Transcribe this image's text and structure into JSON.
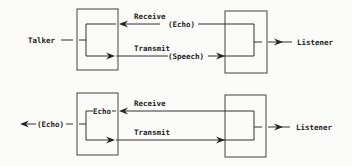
{
  "diagrams": [
    {
      "name": "without-echo-canceller",
      "talker_label": "Talker",
      "listener_label": "Listener",
      "receive_label": "Receive",
      "receive_signal": "(Echo)",
      "transmit_label": "Transmit",
      "transmit_signal": "(Speech)"
    },
    {
      "name": "with-echo-path",
      "output_label": "(Echo)",
      "internal_label": "Echo",
      "listener_label": "Listener",
      "receive_label": "Receive",
      "transmit_label": "Transmit"
    }
  ]
}
